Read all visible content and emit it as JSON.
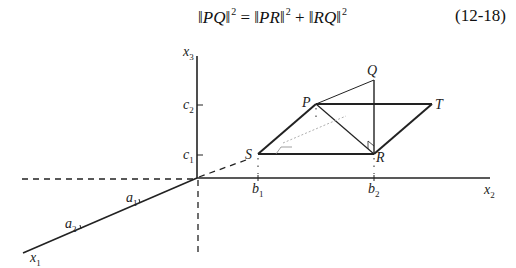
{
  "equation": {
    "lhs": "PQ",
    "rhs_term1": "PR",
    "rhs_term2": "RQ",
    "exponent": "2",
    "equals": "=",
    "plus": "+",
    "number": "(12-18)"
  },
  "diagram": {
    "axes": {
      "x1": {
        "name": "x",
        "sub": "1"
      },
      "x2": {
        "name": "x",
        "sub": "2"
      },
      "x3": {
        "name": "x",
        "sub": "3"
      }
    },
    "ticks": {
      "a1": {
        "name": "a",
        "sub": "1"
      },
      "a2": {
        "name": "a",
        "sub": "2"
      },
      "b1": {
        "name": "b",
        "sub": "1"
      },
      "b2": {
        "name": "b",
        "sub": "2"
      },
      "c1": {
        "name": "c",
        "sub": "1"
      },
      "c2": {
        "name": "c",
        "sub": "2"
      }
    },
    "points": {
      "P": "P",
      "Q": "Q",
      "R": "R",
      "S": "S",
      "T": "T"
    }
  }
}
